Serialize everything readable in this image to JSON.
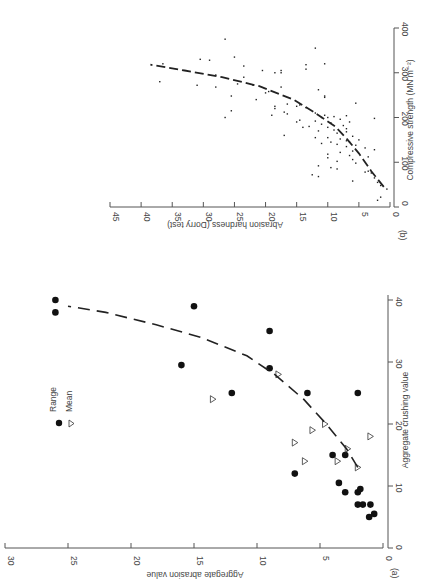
{
  "figure": {
    "panel_a_label": "(a)",
    "panel_b_label": "(b)",
    "legend": {
      "range_label": "Range",
      "mean_label": "Mean",
      "range_symbol": "filled-circle",
      "mean_symbol": "open-triangle"
    },
    "colors": {
      "ink": "#222222",
      "axis": "#555555",
      "background": "#ffffff"
    }
  },
  "chart_data": [
    {
      "panel": "(a)",
      "type": "scatter",
      "title": "",
      "xlabel": "Aggregate crushing value",
      "ylabel": "Aggregate abrasion value",
      "xlim": [
        0,
        40
      ],
      "ylim": [
        0,
        30
      ],
      "xticks": [
        0,
        10,
        20,
        30,
        40
      ],
      "yticks": [
        0,
        5,
        10,
        15,
        20,
        25,
        30
      ],
      "grid": false,
      "legend_position": "upper left",
      "orientation_note": "figure rotated 90 degrees",
      "series": [
        {
          "name": "Range",
          "marker": "filled-circle",
          "points": [
            [
              38,
              26
            ],
            [
              40,
              26
            ],
            [
              39,
              15
            ],
            [
              35,
              9
            ],
            [
              29.5,
              16
            ],
            [
              29,
              9
            ],
            [
              25,
              12
            ],
            [
              25,
              6
            ],
            [
              25,
              2
            ],
            [
              12,
              7
            ],
            [
              15,
              4
            ],
            [
              15,
              3
            ],
            [
              10.5,
              3.5
            ],
            [
              9,
              3
            ],
            [
              9,
              2
            ],
            [
              9.5,
              1.8
            ],
            [
              7,
              2
            ],
            [
              7,
              1.6
            ],
            [
              7,
              1
            ],
            [
              5,
              1.1
            ],
            [
              5.5,
              0.7
            ]
          ]
        },
        {
          "name": "Mean",
          "marker": "open-triangle",
          "points": [
            [
              28,
              8.3
            ],
            [
              24,
              13.5
            ],
            [
              20,
              4.6
            ],
            [
              19,
              5.6
            ],
            [
              17,
              7
            ],
            [
              16,
              2.8
            ],
            [
              14,
              6.2
            ],
            [
              14,
              3.6
            ],
            [
              18,
              1
            ],
            [
              13,
              2
            ]
          ]
        },
        {
          "name": "Trend",
          "marker": "dashed-line",
          "points": [
            [
              13,
              2
            ],
            [
              16,
              2.9
            ],
            [
              20,
              4.5
            ],
            [
              24,
              6.3
            ],
            [
              28,
              8.6
            ],
            [
              31,
              10.8
            ],
            [
              34,
              14.5
            ],
            [
              36,
              18
            ],
            [
              38,
              22
            ],
            [
              39,
              25
            ]
          ]
        }
      ]
    },
    {
      "panel": "(b)",
      "type": "scatter",
      "title": "",
      "xlabel": "Compressive strength (MN m⁻²)",
      "ylabel": "Abrasion hardness (Dorry test)",
      "xlim": [
        0,
        400
      ],
      "ylim": [
        0,
        45
      ],
      "xticks": [
        0,
        100,
        200,
        300,
        400
      ],
      "yticks": [
        0,
        5,
        10,
        15,
        20,
        25,
        30,
        35,
        40,
        45
      ],
      "grid": false,
      "series": [
        {
          "name": "Observations",
          "marker": "dot",
          "points": [
            [
              375,
              26.5
            ],
            [
              355,
              12
            ],
            [
              335,
              25
            ],
            [
              330,
              30.5
            ],
            [
              328,
              29
            ],
            [
              320,
              36.5
            ],
            [
              320,
              10.5
            ],
            [
              315,
              23.5
            ],
            [
              318,
              13.5
            ],
            [
              308,
              13.5
            ],
            [
              305,
              20.5
            ],
            [
              300,
              18.5
            ],
            [
              300,
              17.5
            ],
            [
              305,
              17.5
            ],
            [
              295,
              28
            ],
            [
              290,
              23.5
            ],
            [
              280,
              37
            ],
            [
              272,
              31
            ],
            [
              275,
              24.5
            ],
            [
              272,
              22
            ],
            [
              268,
              28
            ],
            [
              268,
              17.5
            ],
            [
              262,
              11.5
            ],
            [
              258,
              19.5
            ],
            [
              255,
              20
            ],
            [
              248,
              25.5
            ],
            [
              248,
              10.5
            ],
            [
              245,
              10.5
            ],
            [
              240,
              21.5
            ],
            [
              232,
              5.5
            ],
            [
              230,
              16.5
            ],
            [
              228,
              14.5
            ],
            [
              225,
              18.5
            ],
            [
              225,
              15
            ],
            [
              222,
              13.5
            ],
            [
              220,
              18.5
            ],
            [
              215,
              25.5
            ],
            [
              212,
              17
            ],
            [
              210,
              12
            ],
            [
              208,
              16.5
            ],
            [
              205,
              19
            ],
            [
              205,
              10.5
            ],
            [
              204,
              7
            ],
            [
              202,
              9
            ],
            [
              200,
              26.5
            ],
            [
              200,
              11
            ],
            [
              200,
              10
            ],
            [
              198,
              2.5
            ],
            [
              196,
              8
            ],
            [
              194,
              14.5
            ],
            [
              192,
              12
            ],
            [
              190,
              15
            ],
            [
              190,
              6.5
            ],
            [
              188,
              9.5
            ],
            [
              185,
              11
            ],
            [
              182,
              7.5
            ],
            [
              180,
              13
            ],
            [
              178,
              10
            ],
            [
              178,
              14
            ],
            [
              175,
              7
            ],
            [
              172,
              9
            ],
            [
              170,
              11.5
            ],
            [
              168,
              7
            ],
            [
              165,
              8.5
            ],
            [
              160,
              17
            ],
            [
              158,
              6
            ],
            [
              155,
              10
            ],
            [
              155,
              12
            ],
            [
              152,
              8
            ],
            [
              150,
              5
            ],
            [
              148,
              7
            ],
            [
              145,
              9.5
            ],
            [
              145,
              6.5
            ],
            [
              142,
              11
            ],
            [
              140,
              8.5
            ],
            [
              138,
              5.5
            ],
            [
              135,
              7
            ],
            [
              132,
              4
            ],
            [
              128,
              2.5
            ],
            [
              125,
              6
            ],
            [
              122,
              8
            ],
            [
              118,
              10
            ],
            [
              115,
              6.5
            ],
            [
              112,
              3.5
            ],
            [
              110,
              10
            ],
            [
              106,
              6
            ],
            [
              102,
              8.5
            ],
            [
              98,
              5.5
            ],
            [
              92,
              11.5
            ],
            [
              88,
              9.5
            ],
            [
              85,
              8.5
            ],
            [
              80,
              3.5
            ],
            [
              78,
              4
            ],
            [
              76,
              3
            ],
            [
              72,
              12.5
            ],
            [
              68,
              11.5
            ],
            [
              65,
              2.5
            ],
            [
              58,
              6
            ],
            [
              55,
              2
            ],
            [
              48,
              1.5
            ],
            [
              40,
              0.5
            ],
            [
              22,
              1.5
            ],
            [
              15,
              2
            ]
          ]
        },
        {
          "name": "Trend",
          "marker": "dashed-line",
          "points": [
            [
              45,
              1
            ],
            [
              80,
              3
            ],
            [
              120,
              5
            ],
            [
              150,
              6.8
            ],
            [
              180,
              8.8
            ],
            [
              210,
              12
            ],
            [
              240,
              15.5
            ],
            [
              270,
              21
            ],
            [
              290,
              27
            ],
            [
              305,
              33
            ],
            [
              318,
              38.5
            ]
          ]
        }
      ]
    }
  ]
}
